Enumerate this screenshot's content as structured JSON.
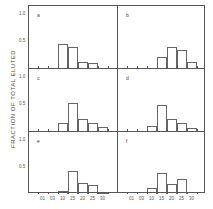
{
  "chart_data": {
    "type": "bar",
    "layout": "3x2 grid of histograms",
    "ylabel": "FRACTION OF TOTAL ELUTED",
    "xlabel": "",
    "x_tick_labels": [
      "01",
      "03",
      "10",
      "15",
      "20",
      "25",
      "30"
    ],
    "y_tick_labels": [
      "1.0",
      "0.5"
    ],
    "ylim": [
      0,
      1.2
    ],
    "panels": [
      {
        "label": "a",
        "categories": [
          "10",
          "15",
          "20",
          "25"
        ],
        "values": [
          0.45,
          0.38,
          0.12,
          0.1
        ],
        "bin_start_index": 2
      },
      {
        "label": "b",
        "categories": [
          "15",
          "20",
          "25",
          "30"
        ],
        "values": [
          0.2,
          0.38,
          0.34,
          0.12
        ],
        "bin_start_index": 3
      },
      {
        "label": "c",
        "categories": [
          "10",
          "15",
          "20",
          "25",
          "30"
        ],
        "values": [
          0.15,
          0.52,
          0.22,
          0.14,
          0.07
        ],
        "bin_start_index": 2
      },
      {
        "label": "d",
        "categories": [
          "10",
          "15",
          "20",
          "25",
          "30"
        ],
        "values": [
          0.1,
          0.48,
          0.22,
          0.15,
          0.06
        ],
        "bin_start_index": 2
      },
      {
        "label": "e",
        "categories": [
          "10",
          "15",
          "20",
          "25",
          "30"
        ],
        "values": [
          0.05,
          0.42,
          0.2,
          0.16,
          0.02
        ],
        "bin_start_index": 2
      },
      {
        "label": "f",
        "categories": [
          "10",
          "15",
          "20",
          "25"
        ],
        "values": [
          0.12,
          0.38,
          0.18,
          0.28
        ],
        "bin_start_index": 2
      }
    ]
  }
}
